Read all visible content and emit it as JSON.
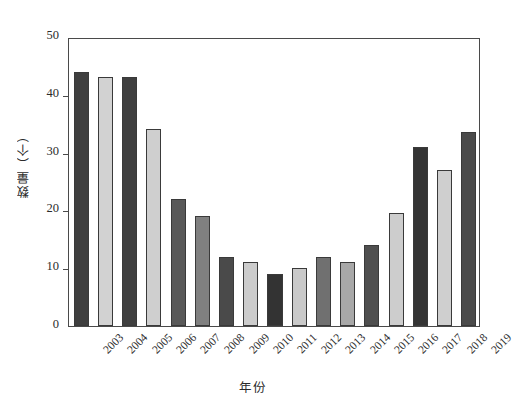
{
  "chart_data": {
    "type": "bar",
    "title": "",
    "xlabel": "年份",
    "ylabel": "数量（个）",
    "categories": [
      "2003",
      "2004",
      "2005",
      "2006",
      "2007",
      "2008",
      "2009",
      "2010",
      "2011",
      "2012",
      "2013",
      "2014",
      "2015",
      "2016",
      "2017",
      "2018",
      "2019"
    ],
    "values": [
      44,
      43,
      43,
      34,
      22,
      19,
      12,
      11,
      9,
      10,
      12,
      11,
      14,
      19.5,
      31,
      27,
      33.5
    ],
    "bar_colors": [
      "#3f3f3f",
      "#d2d2d2",
      "#3f3f3f",
      "#cfcfcf",
      "#595959",
      "#808080",
      "#4a4a4a",
      "#cccccc",
      "#333333",
      "#c9c9c9",
      "#707070",
      "#a8a8a8",
      "#4f4f4f",
      "#cdcdcd",
      "#343434",
      "#cfcfcf",
      "#4b4b4b"
    ],
    "ylim": [
      0,
      50
    ],
    "yticks": [
      0,
      10,
      20,
      30,
      40,
      50
    ],
    "ytick_labels": [
      "0",
      "10",
      "20",
      "30",
      "40",
      "50"
    ],
    "grid": false,
    "legend": null
  },
  "axis": {
    "frame_color": "#4a4a4a",
    "text_color": "#2b2b2b"
  }
}
